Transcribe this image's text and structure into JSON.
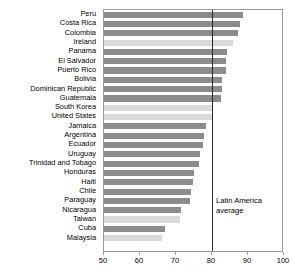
{
  "chart_data": {
    "type": "bar",
    "orientation": "horizontal",
    "title": "",
    "xlabel": "",
    "ylabel": "",
    "xlim": [
      50,
      100
    ],
    "xticks": [
      50,
      60,
      70,
      80,
      90,
      100
    ],
    "grid": false,
    "legend": "none",
    "categories": [
      "Peru",
      "Costa Rica",
      "Colombia",
      "Ireland",
      "Panama",
      "El Salvador",
      "Puerto Rico",
      "Bolivia",
      "Dominican Republic",
      "Guatemala",
      "South Korea",
      "United States",
      "Jamaica",
      "Argentina",
      "Ecuador",
      "Uruguay",
      "Trinidad and Tobago",
      "Honduras",
      "Haiti",
      "Chile",
      "Paraguay",
      "Nicaragua",
      "Taiwan",
      "Cuba",
      "Malaysia"
    ],
    "values": [
      88.5,
      87.8,
      87.2,
      85.8,
      84.3,
      84.0,
      83.8,
      82.8,
      82.8,
      82.5,
      80.0,
      80.0,
      78.3,
      77.8,
      77.5,
      76.8,
      76.5,
      75.0,
      74.8,
      74.3,
      73.8,
      71.5,
      71.0,
      67.0,
      66.0
    ],
    "groups": [
      "latam",
      "latam",
      "latam",
      "other",
      "latam",
      "latam",
      "latam",
      "latam",
      "latam",
      "latam",
      "other",
      "other",
      "latam",
      "latam",
      "latam",
      "latam",
      "latam",
      "latam",
      "latam",
      "latam",
      "latam",
      "latam",
      "other",
      "latam",
      "other"
    ],
    "group_colors": {
      "latam": "#8c8c8c",
      "other": "#d9d9d9"
    },
    "annotations": [
      {
        "name": "latin-america-average",
        "text": "Latin America average",
        "line_value": 80,
        "line_color": "#2b2b2b"
      }
    ]
  }
}
